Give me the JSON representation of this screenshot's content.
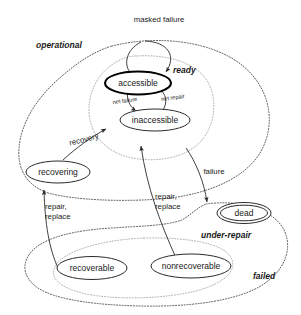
{
  "diagram": {
    "type": "state-diagram",
    "colors": {
      "accessible_fill": "#c3c3c3",
      "node_stroke": "#2b2b2b",
      "region_stroke": "#4a4a4a",
      "region_stroke_faint": "#9a9a9a",
      "background": "#ffffff",
      "text": "#1a1a1a"
    },
    "states": [
      {
        "id": "accessible",
        "label": "accessible",
        "highlighted": true,
        "double_border": false
      },
      {
        "id": "inaccessible",
        "label": "inaccessible",
        "highlighted": false,
        "double_border": false
      },
      {
        "id": "recovering",
        "label": "recovering",
        "highlighted": false,
        "double_border": false
      },
      {
        "id": "dead",
        "label": "dead",
        "highlighted": false,
        "double_border": true
      },
      {
        "id": "recoverable",
        "label": "recoverable",
        "highlighted": false,
        "double_border": false
      },
      {
        "id": "nonrecoverable",
        "label": "nonrecoverable",
        "highlighted": false,
        "double_border": false
      }
    ],
    "regions": [
      {
        "id": "operational",
        "label": "operational",
        "style": "dotted"
      },
      {
        "id": "ready",
        "label": "ready",
        "style": "dotted-faint"
      },
      {
        "id": "under-repair",
        "label": "under-repair",
        "style": "dotted-faint"
      },
      {
        "id": "failed",
        "label": "failed",
        "style": "dotted"
      }
    ],
    "transitions": [
      {
        "id": "masked-failure",
        "label": "masked failure",
        "from": "ready",
        "to": "accessible"
      },
      {
        "id": "net-failure",
        "label": "net failure",
        "from": "accessible",
        "to": "inaccessible"
      },
      {
        "id": "net-repair",
        "label": "net repair",
        "from": "inaccessible",
        "to": "accessible"
      },
      {
        "id": "recovery",
        "label": "recovery",
        "from": "recovering",
        "to": "ready"
      },
      {
        "id": "failure",
        "label": "failure",
        "from": "ready",
        "to": "dead"
      },
      {
        "id": "repair-replace-left",
        "label": "repair,\nreplace",
        "from": "recoverable",
        "to": "recovering"
      },
      {
        "id": "repair-replace-middle",
        "label": "repair,\nreplace",
        "from": "nonrecoverable",
        "to": "inaccessible"
      }
    ],
    "labels": {
      "masked_failure": "masked failure",
      "net_failure": "net failure",
      "net_repair": "net repair",
      "recovery": "recovery",
      "failure": "failure",
      "repair_line1": "repair,",
      "repair_line2": "replace",
      "repair_mid_line1": "repair,",
      "repair_mid_line2": "replace",
      "operational": "operational",
      "ready": "ready",
      "under_repair": "under-repair",
      "failed": "failed",
      "accessible": "accessible",
      "inaccessible": "inaccessible",
      "recovering": "recovering",
      "dead": "dead",
      "recoverable": "recoverable",
      "nonrecoverable": "nonrecoverable"
    }
  }
}
